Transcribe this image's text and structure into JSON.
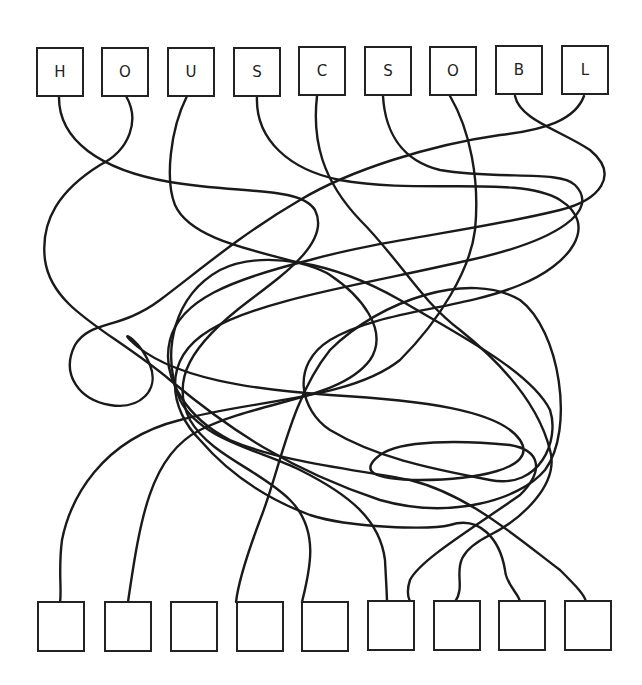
{
  "puzzle": {
    "type": "tangled-lines",
    "line_color": "#1a1a1a",
    "background": "#ffffff",
    "top_letters": [
      "H",
      "O",
      "U",
      "S",
      "C",
      "S",
      "O",
      "B",
      "L"
    ],
    "bottom_boxes": [
      "",
      "",
      "",
      "",
      "",
      "",
      "",
      "",
      ""
    ]
  }
}
